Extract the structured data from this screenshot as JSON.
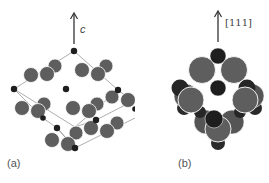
{
  "figure": {
    "panel_a": {
      "label": "(a)",
      "axis_label": "c",
      "description": "Unit cell with large grey atoms and small dark atoms, c axis arrow upward"
    },
    "panel_b": {
      "label": "(b)",
      "axis_label": "[111]",
      "description": "Close-packed cluster of large grey and dark atoms viewed with [111] arrow upward"
    },
    "colors": {
      "large_atom": "#5e5e5e",
      "large_atom_dark": "#4a4a4a",
      "small_atom": "#1e1e1e",
      "bond_line": "#8a8a8a",
      "arrow": "#333333",
      "background": "#ffffff"
    }
  }
}
